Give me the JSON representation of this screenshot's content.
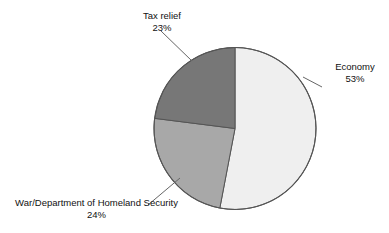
{
  "figure": {
    "kind": "pie-chart-figure",
    "background": "#ffffff",
    "outline_color": "#555555"
  },
  "chart_data": {
    "type": "pie",
    "title": "",
    "subtitle": "",
    "xlabel": "",
    "ylabel": "",
    "grid": false,
    "legend_position": "none",
    "label_format": "name + percent",
    "start_angle_deg": 0,
    "direction": "clockwise",
    "categories": [
      "Economy",
      "War/Department of Homeland Security",
      "Tax relief"
    ],
    "values": [
      53,
      24,
      23
    ],
    "value_labels": [
      "53%",
      "24%",
      "23%"
    ],
    "colors": [
      "#efefef",
      "#a8a8a8",
      "#777777"
    ],
    "slices": [
      {
        "name": "Economy",
        "percent": 53,
        "percent_label": "53%",
        "color": "#efefef",
        "start_angle_deg": 0,
        "end_angle_deg": 190.8,
        "label_anchor": "right"
      },
      {
        "name": "War/Department of Homeland Security",
        "percent": 24,
        "percent_label": "24%",
        "color": "#a8a8a8",
        "start_angle_deg": 190.8,
        "end_angle_deg": 277.2,
        "label_anchor": "bottom-left"
      },
      {
        "name": "Tax relief",
        "percent": 23,
        "percent_label": "23%",
        "color": "#777777",
        "start_angle_deg": 277.2,
        "end_angle_deg": 360,
        "label_anchor": "top"
      }
    ]
  },
  "labels": {
    "economy": {
      "name": "Economy",
      "value": "53%"
    },
    "war_dhs": {
      "name": "War/Department of Homeland Security",
      "value": "24%"
    },
    "tax_relief": {
      "name": "Tax relief",
      "value": "23%"
    }
  }
}
